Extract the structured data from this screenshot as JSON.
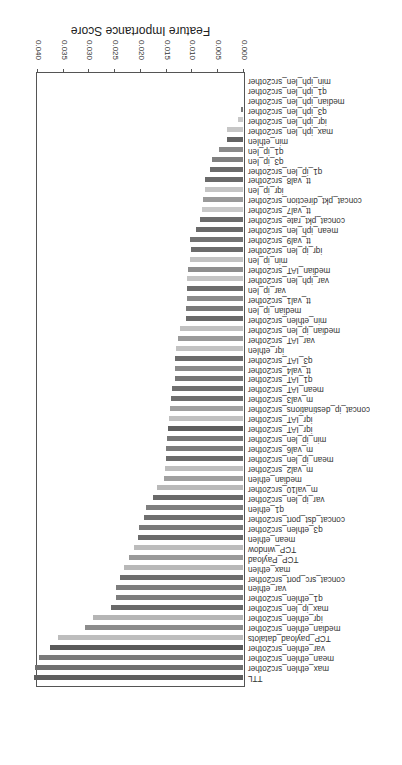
{
  "chart_data": {
    "type": "bar",
    "orientation": "horizontal",
    "display_rotation_deg": 180,
    "title": "",
    "xlabel": "Feature Importance Score",
    "ylabel": "",
    "xlim": [
      0.0,
      0.041
    ],
    "xticks": [
      "0.000",
      "0.005",
      "0.010",
      "0.015",
      "0.020",
      "0.025",
      "0.030",
      "0.035",
      "0.040"
    ],
    "grid": false,
    "legend": null,
    "categories": [
      "TTL",
      "max_ethlen_src2other",
      "mean_ethlen_src2other",
      "var_ethlen_src2other",
      "TCP_payload_datalots",
      "median_ethlen_src2other",
      "iqr_ethlen_src2other",
      "max_ip_len_src2other",
      "q1_ethlen_src2other",
      "var_ethlen",
      "concat_src_port_src2other",
      "max_ethlen",
      "TCP_Payload",
      "TCP_window",
      "mean_ethlen",
      "q3_ethlen_src2other",
      "concat_dst_port_src2other",
      "q1_ethlen",
      "var_ip_len_src2other",
      "m_val10_src2other",
      "median_ethlen",
      "m_val2_src2other",
      "mean_ip_len_src2other",
      "m_val6_src2other",
      "min_ip_len_src2other",
      "iqr_IAT_src2other",
      "iqr_IAT_src2other",
      "concat_ip_destinations_src2other",
      "m_val3_src2other",
      "mean_IAT_src2other",
      "q1_IAT_src2other",
      "tt_val4_src2other",
      "q3_IAT_src2other",
      "iqr_ethlen",
      "var_IAT_src2other",
      "median_ip_len_src2other",
      "min_ethlen_src2other",
      "median_ip_len",
      "tt_val1_src2other",
      "var_ip_len",
      "var_iph_len_src2other",
      "median_IAT_src2other",
      "min_ip_len",
      "iqr_ip_len_src2other",
      "tt_val9_src2other",
      "mean_iph_len_src2other",
      "concat_pkt_rate_src2other",
      "tt_val7_src2other",
      "concat_pkt_direction_src2other",
      "iqr_ip_len",
      "tt_val8_src2other",
      "q1_ip_len_src2other",
      "q3_ip_len",
      "q1_ip_len",
      "min_ethlen",
      "max_iph_len_src2other",
      "iqr_iph_len_src2other",
      "q3_iph_len_src2other",
      "median_iph_len_src2other",
      "q1_iph_len_src2other",
      "min_iph_len_src2other"
    ],
    "values": [
      0.0405,
      0.0403,
      0.0396,
      0.0375,
      0.0359,
      0.0307,
      0.0291,
      0.0256,
      0.0247,
      0.0247,
      0.0239,
      0.0231,
      0.0221,
      0.0212,
      0.0204,
      0.0202,
      0.0192,
      0.0188,
      0.0175,
      0.0167,
      0.0153,
      0.0151,
      0.015,
      0.015,
      0.0148,
      0.0146,
      0.0144,
      0.0142,
      0.014,
      0.0138,
      0.0132,
      0.0132,
      0.0132,
      0.013,
      0.0126,
      0.0122,
      0.0111,
      0.0111,
      0.0109,
      0.0109,
      0.0109,
      0.0107,
      0.0103,
      0.0101,
      0.0103,
      0.0092,
      0.0084,
      0.008,
      0.0078,
      0.0074,
      0.0074,
      0.0064,
      0.006,
      0.0047,
      0.0031,
      0.0031,
      0.001,
      0.0004,
      0.0,
      0.0,
      0.0
    ],
    "bar_colors": [
      "#5f5f5f",
      "#707070",
      "#7a7a7a",
      "#5a5a5a",
      "#bdbdbd",
      "#8c8c8c",
      "#b5b5b5",
      "#6a6a6a",
      "#7d7d7d",
      "#7d7d7d",
      "#6e6e6e",
      "#b8b8b8",
      "#9a9a9a",
      "#bcbcbc",
      "#6b6b6b",
      "#7a7a7a",
      "#6f6f6f",
      "#7f7f7f",
      "#6a6a6a",
      "#b9b9b9",
      "#a0a0a0",
      "#bdbdbd",
      "#6c6c6c",
      "#7c7c7c",
      "#777777",
      "#5f5f5f",
      "#c0c0c0",
      "#a0a0a0",
      "#6f6f6f",
      "#707070",
      "#767676",
      "#8a8a8a",
      "#6c6c6c",
      "#c2c2c2",
      "#9a9a9a",
      "#c0c0c0",
      "#6a6a6a",
      "#7a7a7a",
      "#8a8a8a",
      "#6d6d6d",
      "#c4c4c4",
      "#8e8e8e",
      "#c2c2c2",
      "#6c6c6c",
      "#737373",
      "#6a6a6a",
      "#6c6c6c",
      "#c8c8c8",
      "#9a9a9a",
      "#c4c4c4",
      "#6a6a6a",
      "#6b6b6b",
      "#808080",
      "#8a8a8a",
      "#636363",
      "#c6c6c6",
      "#c8c8c8",
      "#777777",
      "#bbbbbb",
      "#bbbbbb",
      "#bbbbbb"
    ]
  }
}
